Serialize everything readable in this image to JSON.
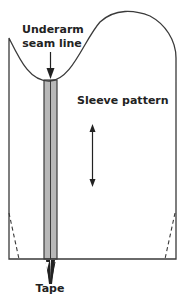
{
  "diagram": {
    "labels": {
      "underarm_line1": "Underarm",
      "underarm_line2": "seam line",
      "sleeve_pattern": "Sleeve pattern",
      "tape": "Tape"
    },
    "colors": {
      "outline": "#3a3a3a",
      "tape_fill": "#b8b8b8",
      "background": "#ffffff"
    }
  }
}
